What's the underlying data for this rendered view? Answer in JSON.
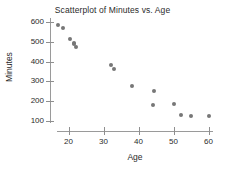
{
  "chart_data": {
    "type": "scatter",
    "title": "Scatterplot of Minutes vs. Age",
    "xlabel": "Age",
    "ylabel": "Minutes",
    "xlim": [
      15,
      63
    ],
    "ylim": [
      90,
      620
    ],
    "xticks": [
      20,
      30,
      40,
      50,
      60
    ],
    "yticks": [
      100,
      200,
      300,
      400,
      500,
      600
    ],
    "grid": false,
    "legend": null,
    "point_color": "#777777",
    "axis_color": "#9a9a9a",
    "series": [
      {
        "name": "Minutes vs. Age",
        "points": [
          {
            "x": 17,
            "y": 585
          },
          {
            "x": 18.5,
            "y": 568
          },
          {
            "x": 20.5,
            "y": 512
          },
          {
            "x": 21.5,
            "y": 495
          },
          {
            "x": 21.5,
            "y": 487
          },
          {
            "x": 22,
            "y": 475
          },
          {
            "x": 32,
            "y": 383
          },
          {
            "x": 33,
            "y": 363
          },
          {
            "x": 38,
            "y": 275
          },
          {
            "x": 44.5,
            "y": 252
          },
          {
            "x": 44,
            "y": 182
          },
          {
            "x": 50,
            "y": 188
          },
          {
            "x": 52,
            "y": 130
          },
          {
            "x": 55,
            "y": 125
          },
          {
            "x": 60,
            "y": 125
          }
        ]
      }
    ]
  }
}
